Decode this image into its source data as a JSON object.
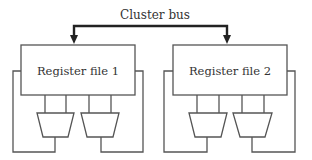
{
  "diagram": {
    "bus_label": "Cluster bus",
    "register_files": [
      {
        "label": "Register file 1"
      },
      {
        "label": "Register file 2"
      }
    ],
    "colors": {
      "line": "#555555",
      "bus": "#222222",
      "text": "#333333",
      "background": "#ffffff"
    }
  }
}
